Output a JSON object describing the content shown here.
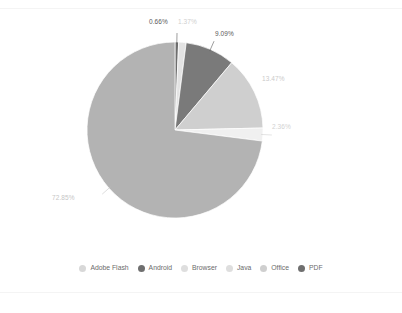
{
  "chart_data": {
    "type": "pie",
    "title": "",
    "subtitle": "",
    "xlabel": "",
    "ylabel": "",
    "legend_position": "bottom",
    "grid": false,
    "start_angle_deg": 0,
    "direction": "clockwise",
    "categories": [
      "PDF",
      "Office",
      "Android",
      "Adobe Flash",
      "Java",
      "Browser"
    ],
    "values": [
      0.66,
      1.37,
      9.09,
      13.47,
      2.36,
      72.85
    ],
    "slices": [
      {
        "name": "PDF",
        "value": 0.66,
        "label": "0.66%",
        "color": "#6e6e6e",
        "label_color": "#5a5a5a",
        "label_x": 149,
        "label_y": 19,
        "leader": true
      },
      {
        "name": "Office",
        "value": 1.37,
        "label": "1.37%",
        "color": "#e3e3e3",
        "label_color": "#cfcfcf",
        "label_x": 178,
        "label_y": 19,
        "leader": false
      },
      {
        "name": "Android",
        "value": 9.09,
        "label": "9.09%",
        "color": "#7a7a7a",
        "label_color": "#5a5a5a",
        "label_x": 215,
        "label_y": 31,
        "leader": true
      },
      {
        "name": "Adobe Flash",
        "value": 13.47,
        "label": "13.47%",
        "color": "#cfcfcf",
        "label_color": "#cacaca",
        "label_x": 262,
        "label_y": 76,
        "leader": false
      },
      {
        "name": "Java",
        "value": 2.36,
        "label": "2.36%",
        "color": "#f0f0f0",
        "label_color": "#d2d2d2",
        "label_x": 272,
        "label_y": 124,
        "leader": true
      },
      {
        "name": "Browser",
        "value": 72.85,
        "label": "72.85%",
        "color": "#b3b3b3",
        "label_color": "#c6c6c6",
        "label_x": 52,
        "label_y": 195,
        "leader": true
      }
    ],
    "geometry": {
      "center_x": 175,
      "center_y": 130,
      "radius": 88
    }
  },
  "legend": {
    "items": [
      {
        "label": "Adobe Flash",
        "color": "#d8d8d8"
      },
      {
        "label": "Android",
        "color": "#6f6f6f"
      },
      {
        "label": "Browser",
        "color": "#dedede"
      },
      {
        "label": "Java",
        "color": "#dedede"
      },
      {
        "label": "Office",
        "color": "#cfcfcf"
      },
      {
        "label": "PDF",
        "color": "#6f6f6f"
      }
    ]
  }
}
